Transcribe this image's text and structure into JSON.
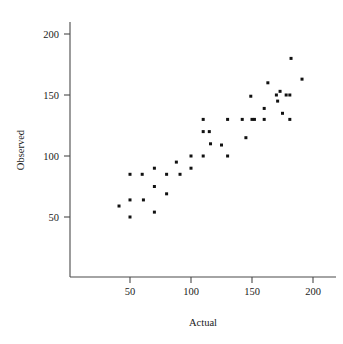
{
  "chart_data": {
    "type": "scatter",
    "title": "",
    "xlabel": "Actual",
    "ylabel": "Observed",
    "xlim": [
      20,
      212
    ],
    "ylim": [
      20,
      212
    ],
    "xticks": [
      50,
      100,
      150,
      200
    ],
    "yticks": [
      50,
      100,
      150,
      200
    ],
    "xtick_labels": [
      "50",
      "100",
      "150",
      "200"
    ],
    "ytick_labels": [
      "50",
      "100",
      "150",
      "200"
    ],
    "grid": false,
    "legend": null,
    "marker": "filled-square",
    "marker_color": "#111111",
    "series": [
      {
        "name": "observations",
        "points": [
          [
            41,
            59
          ],
          [
            50,
            85
          ],
          [
            50,
            64
          ],
          [
            50,
            50
          ],
          [
            60,
            85
          ],
          [
            61,
            64
          ],
          [
            70,
            90
          ],
          [
            70,
            75
          ],
          [
            70,
            54
          ],
          [
            80,
            85
          ],
          [
            80,
            69
          ],
          [
            88,
            95
          ],
          [
            91,
            85
          ],
          [
            100,
            100
          ],
          [
            100,
            90
          ],
          [
            110,
            130
          ],
          [
            110,
            120
          ],
          [
            110,
            100
          ],
          [
            115,
            120
          ],
          [
            116,
            110
          ],
          [
            125,
            109
          ],
          [
            130,
            130
          ],
          [
            130,
            100
          ],
          [
            142,
            130
          ],
          [
            145,
            115
          ],
          [
            149,
            149
          ],
          [
            150,
            130
          ],
          [
            152,
            130
          ],
          [
            160,
            130
          ],
          [
            160,
            139
          ],
          [
            163,
            160
          ],
          [
            170,
            150
          ],
          [
            171,
            145
          ],
          [
            173,
            153
          ],
          [
            175,
            135
          ],
          [
            178,
            150
          ],
          [
            181,
            150
          ],
          [
            181,
            130
          ],
          [
            182,
            180
          ],
          [
            191,
            163
          ]
        ]
      }
    ]
  },
  "labels": {
    "x_axis_title": "Actual",
    "y_axis_title": "Observed"
  }
}
